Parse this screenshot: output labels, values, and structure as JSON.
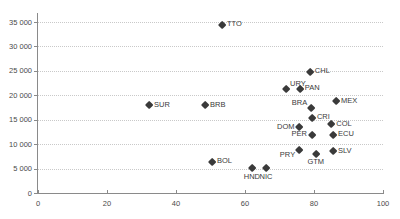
{
  "chart_data": {
    "type": "scatter",
    "title": "",
    "xlabel": "",
    "ylabel": "",
    "xlim": [
      0,
      100
    ],
    "ylim": [
      0,
      35000
    ],
    "xticks": [
      "0",
      "20",
      "40",
      "60",
      "80",
      "100"
    ],
    "xtick_values": [
      0,
      20,
      40,
      60,
      80,
      100
    ],
    "yticks": [
      "0",
      "5 000",
      "10 000",
      "15 000",
      "20 000",
      "25 000",
      "30 000",
      "35 000"
    ],
    "ytick_values": [
      0,
      5000,
      10000,
      15000,
      20000,
      25000,
      30000,
      35000
    ],
    "grid": "horizontal-dotted",
    "legend": "none",
    "marker": "diamond",
    "marker_color": "#3a3a3a",
    "points": [
      {
        "label": "TTO",
        "x": 53.3,
        "y": 34400,
        "label_pos": "lbl-right"
      },
      {
        "label": "CHL",
        "x": 78.8,
        "y": 24800,
        "label_pos": "lbl-right"
      },
      {
        "label": "URY",
        "x": 71.9,
        "y": 21200,
        "label_pos": "lbl-ur"
      },
      {
        "label": "PAN",
        "x": 75.9,
        "y": 21300,
        "label_pos": "lbl-right"
      },
      {
        "label": "MEX",
        "x": 86.4,
        "y": 18800,
        "label_pos": "lbl-right"
      },
      {
        "label": "BRA",
        "x": 79.2,
        "y": 17400,
        "label_pos": "lbl-ul"
      },
      {
        "label": "SUR",
        "x": 32.2,
        "y": 18000,
        "label_pos": "lbl-right"
      },
      {
        "label": "BRB",
        "x": 48.4,
        "y": 18000,
        "label_pos": "lbl-right"
      },
      {
        "label": "CRI",
        "x": 79.4,
        "y": 15400,
        "label_pos": "lbl-right"
      },
      {
        "label": "COL",
        "x": 85.0,
        "y": 14000,
        "label_pos": "lbl-right"
      },
      {
        "label": "DOM",
        "x": 75.8,
        "y": 13500,
        "label_pos": "lbl-left"
      },
      {
        "label": "ECU",
        "x": 85.5,
        "y": 11900,
        "label_pos": "lbl-right"
      },
      {
        "label": "PER",
        "x": 79.4,
        "y": 11900,
        "label_pos": "lbl-left"
      },
      {
        "label": "SLV",
        "x": 85.5,
        "y": 8500,
        "label_pos": "lbl-right"
      },
      {
        "label": "PRY",
        "x": 75.7,
        "y": 8700,
        "label_pos": "lbl-ll"
      },
      {
        "label": "GTM",
        "x": 80.5,
        "y": 8000,
        "label_pos": "lbl-below"
      },
      {
        "label": "BOL",
        "x": 50.4,
        "y": 6400,
        "label_pos": "lbl-right"
      },
      {
        "label": "HND",
        "x": 62.0,
        "y": 5000,
        "label_pos": "lbl-below"
      },
      {
        "label": "NIC",
        "x": 66.1,
        "y": 5000,
        "label_pos": "lbl-below"
      }
    ]
  },
  "geometry": {
    "origin_x_px": 38,
    "origin_y_px": 193,
    "x_span_px": 345,
    "y_span_px": 171
  }
}
